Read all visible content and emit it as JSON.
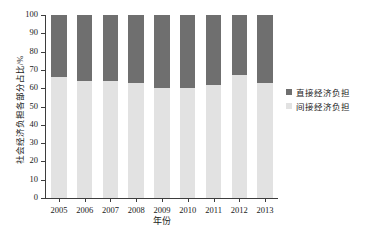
{
  "chart_data": {
    "type": "bar",
    "stacked": true,
    "title": "",
    "xlabel": "年份",
    "ylabel": "社会经济负担各部分占比/%",
    "categories": [
      "2005",
      "2006",
      "2007",
      "2008",
      "2009",
      "2010",
      "2011",
      "2012",
      "2013"
    ],
    "series": [
      {
        "name": "间接经济负担",
        "color": "#e2e2e2",
        "values": [
          66,
          64,
          64,
          63,
          60,
          60,
          62,
          67,
          63
        ]
      },
      {
        "name": "直接经济负担",
        "color": "#6f6f6f",
        "values": [
          34,
          36,
          36,
          37,
          40,
          40,
          38,
          33,
          37
        ]
      }
    ],
    "ylim": [
      0,
      100
    ],
    "yticks": [
      0,
      10,
      20,
      30,
      40,
      50,
      60,
      70,
      80,
      90,
      100
    ],
    "ytick_labels": [
      "0",
      "10",
      "20",
      "30",
      "40",
      "50",
      "60",
      "70",
      "80",
      "90",
      "100"
    ],
    "grid": false,
    "legend_position": "right",
    "legend": [
      {
        "label": "直接经济负担",
        "color": "#6f6f6f"
      },
      {
        "label": "间接经济负担",
        "color": "#e2e2e2"
      }
    ],
    "axis_color": "#3d3d3d",
    "background": "#ffffff"
  }
}
